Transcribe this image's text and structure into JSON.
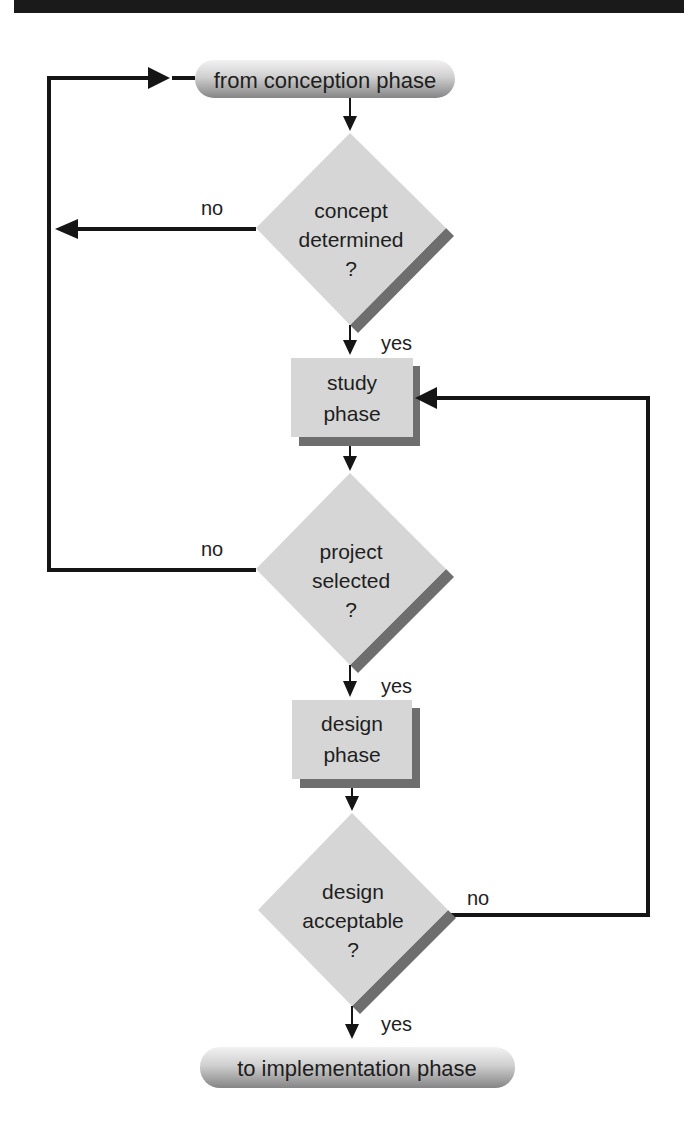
{
  "colors": {
    "shape_fill": "#d6d6d6",
    "shadow": "#6e6e6e",
    "line": "#151515",
    "pill_top": "#efefef",
    "pill_bottom": "#8a8a8a",
    "header_band": "#1a1a1a"
  },
  "flowchart": {
    "start": {
      "label": "from conception phase"
    },
    "end": {
      "label": "to implementation phase"
    },
    "decisions": [
      {
        "line1": "concept",
        "line2": "determined",
        "line3": "?",
        "yes_label": "yes",
        "no_label": "no"
      },
      {
        "line1": "project",
        "line2": "selected",
        "line3": "?",
        "yes_label": "yes",
        "no_label": "no"
      },
      {
        "line1": "design",
        "line2": "acceptable",
        "line3": "?",
        "yes_label": "yes",
        "no_label": "no"
      }
    ],
    "processes": [
      {
        "line1": "study",
        "line2": "phase"
      },
      {
        "line1": "design",
        "line2": "phase"
      }
    ]
  }
}
